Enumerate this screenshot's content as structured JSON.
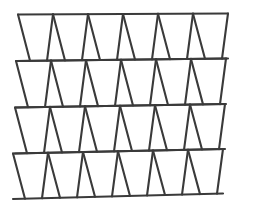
{
  "figure": {
    "type": "geometric-line-figure",
    "background_color": "#ffffff",
    "stroke_color": "#3a3a3a",
    "stroke_width": 2.1,
    "canvas": {
      "width": 253,
      "height": 213
    },
    "row_count": 4,
    "columns_per_row": 6,
    "rows": [
      {
        "name": "row-1",
        "top_y_left": 14.5,
        "top_y_right": 13.5,
        "bottom_y_left": 61.0,
        "bottom_y_right": 58.5,
        "top_nodes": [
          18,
          53,
          88,
          123,
          158,
          193,
          228
        ],
        "bottom_node_pairs": [
          [
            30,
            47
          ],
          [
            65,
            82
          ],
          [
            100,
            117
          ],
          [
            135,
            152
          ],
          [
            170,
            187
          ],
          [
            205,
            222
          ]
        ]
      },
      {
        "name": "row-2",
        "top_y_left": 61.0,
        "top_y_right": 58.5,
        "bottom_y_left": 107.5,
        "bottom_y_right": 104.0,
        "top_nodes": [
          16,
          51,
          86,
          121,
          156,
          191,
          226
        ],
        "bottom_node_pairs": [
          [
            28,
            45
          ],
          [
            63,
            80
          ],
          [
            98,
            115
          ],
          [
            133,
            150
          ],
          [
            168,
            185
          ],
          [
            203,
            220
          ]
        ]
      },
      {
        "name": "row-3",
        "top_y_left": 107.5,
        "top_y_right": 104.0,
        "bottom_y_left": 153.5,
        "bottom_y_right": 149.0,
        "top_nodes": [
          15,
          50,
          85,
          120,
          155,
          190,
          225
        ],
        "bottom_node_pairs": [
          [
            27,
            44
          ],
          [
            62,
            79
          ],
          [
            97,
            114
          ],
          [
            132,
            149
          ],
          [
            167,
            184
          ],
          [
            202,
            219
          ]
        ]
      },
      {
        "name": "row-4",
        "top_y_left": 153.5,
        "top_y_right": 149.0,
        "bottom_y_left": 199.0,
        "bottom_y_right": 193.5,
        "top_nodes": [
          13,
          48,
          83,
          118,
          153,
          188,
          223
        ],
        "bottom_node_pairs": [
          [
            25,
            42
          ],
          [
            60,
            77
          ],
          [
            95,
            112
          ],
          [
            130,
            147
          ],
          [
            165,
            182
          ],
          [
            200,
            217
          ]
        ]
      }
    ]
  }
}
